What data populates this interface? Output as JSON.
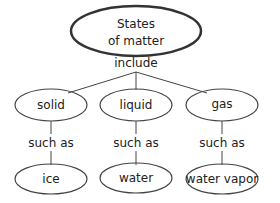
{
  "diagram": {
    "root": {
      "line1": "States",
      "line2": "of matter"
    },
    "root_link": "include",
    "states": [
      {
        "name": "solid",
        "link": "such as",
        "example": "ice"
      },
      {
        "name": "liquid",
        "link": "such as",
        "example": "water"
      },
      {
        "name": "gas",
        "link": "such as",
        "example": "water vapor"
      }
    ]
  }
}
